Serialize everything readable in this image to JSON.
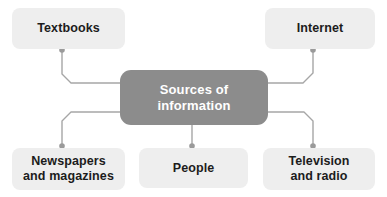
{
  "diagram": {
    "type": "mind-map",
    "title": "Sources of information",
    "center": {
      "id": "center",
      "label": "Sources of\ninformation",
      "line1": "Sources of",
      "line2": "information"
    },
    "branches": [
      {
        "id": "textbooks",
        "label": "Textbooks"
      },
      {
        "id": "internet",
        "label": "Internet"
      },
      {
        "id": "newspapers",
        "label": "Newspapers\nand magazines"
      },
      {
        "id": "people",
        "label": "People"
      },
      {
        "id": "television",
        "label": "Television\nand radio"
      }
    ],
    "colors": {
      "background": "#ffffff",
      "center_fill": "#8c8c8c",
      "center_text": "#ffffff",
      "leaf_fill": "#eeeeee",
      "leaf_text": "#1c1c1c",
      "connector_line": "#a6a6a6",
      "connector_dot": "#9a9a9a"
    }
  }
}
